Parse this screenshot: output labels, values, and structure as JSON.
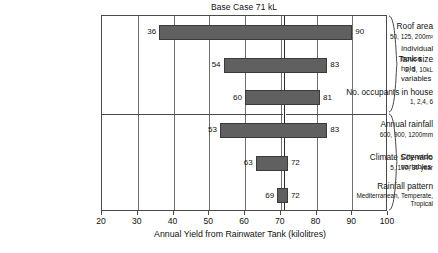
{
  "chart_data": {
    "type": "bar",
    "orientation": "horizontal-tornado",
    "title": "Base Case 71 kL",
    "xlabel": "Annual Yield from Rainwater Tank (kilolitres)",
    "ylabel": "",
    "xlim": [
      20,
      100
    ],
    "xticks": [
      20,
      30,
      40,
      50,
      60,
      70,
      80,
      90,
      100
    ],
    "grid": true,
    "base_case": 71,
    "base_case_label": "Base Case 71 kL",
    "categories": [
      "Roof area",
      "Tank size",
      "No. occupants in house",
      "Annual rainfall",
      "Climate Scenario",
      "Rainfall pattern"
    ],
    "bars": [
      {
        "category": "Roof area",
        "sub": "50, 125, 200m²",
        "low": 36,
        "high": 90,
        "low_label": "36",
        "high_label": "90",
        "group": "Individual house hold variables"
      },
      {
        "category": "Tank size",
        "sub": "2, 5, 10kL",
        "low": 54,
        "high": 83,
        "low_label": "54",
        "high_label": "83",
        "group": "Individual house hold variables"
      },
      {
        "category": "No. occupants in house",
        "sub": "1, 2,4, 6",
        "low": 60,
        "high": 81,
        "low_label": "60",
        "high_label": "81",
        "group": "Individual house hold variables"
      },
      {
        "category": "Annual rainfall",
        "sub": "600, 900, 1200mm",
        "low": 53,
        "high": 83,
        "low_label": "53",
        "high_label": "83",
        "group": "City-wide variables"
      },
      {
        "category": "Climate Scenario",
        "sub": "5, 100, 30 year",
        "low": 63,
        "high": 72,
        "low_label": "63",
        "high_label": "72",
        "group": "City-wide variables"
      },
      {
        "category": "Rainfall pattern",
        "sub": "Mediterranean,\nTemperate, Tropical",
        "low": 69,
        "high": 72,
        "low_label": "69",
        "high_label": "72",
        "group": "City-wide variables"
      }
    ],
    "groups": [
      {
        "label": "Individual\nhouse hold\nvariables",
        "from": 0,
        "to": 2
      },
      {
        "label": "City-wide\nvariables",
        "from": 3,
        "to": 5
      }
    ],
    "colors": {
      "bar_fill": "#606060",
      "bar_stroke": "#3a3a3a",
      "grid": "#6f6f6f",
      "frame": "#4a4a4a",
      "base_case_line": "#2b2b2b",
      "text": "#111111",
      "background": "#ffffff"
    }
  },
  "ticks": {
    "t0": "20",
    "t1": "30",
    "t2": "40",
    "t3": "50",
    "t4": "60",
    "t5": "70",
    "t6": "80",
    "t7": "90",
    "t8": "100"
  }
}
